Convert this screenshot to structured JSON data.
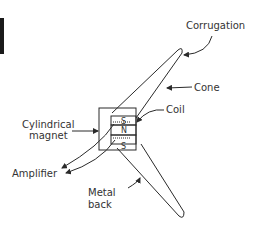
{
  "diagram": {
    "labels": {
      "corrugation": "Corrugation",
      "cone": "Cone",
      "coil": "Coil",
      "magnet_line1": "Cylindrical",
      "magnet_line2": "magnet",
      "amplifier": "Amplifier",
      "back_line1": "Metal",
      "back_line2": "back"
    },
    "poles": {
      "top": "S",
      "middle": "N",
      "bottom": "S"
    },
    "colors": {
      "line": "#2a2a2a",
      "text": "#333333",
      "background": "#ffffff"
    }
  }
}
